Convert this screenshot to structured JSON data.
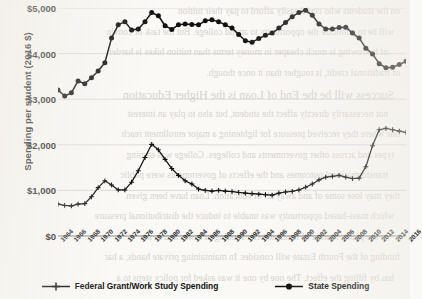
{
  "page": {
    "background_color": "#faf9f6",
    "ink_color": "#111111",
    "bleed_through_lines": [
      "on the students who could easily afford to pay their tuition",
      "will be to publicize the opportunity to attend college. But the task of convin",
      "of borrowing is much cheaper in money terms than tuition hikes is harder",
      "of traditional credit, is tougher than it once though.",
      "Success will be the End of Loan is the Higher Education",
      "not necessarily directly affect the student, but also to play an interest",
      "one where they received pressure for lightening a major enrollment reach",
      "types and across other governments and colleges. College was earning",
      "transformational outcomes and the effects of governments were public",
      "they may lose some of and away all of education. Loan have been given",
      "which mass-based opportunity was unable to induce the distributional pressure",
      "in the public market of hands to offer funding of lower and in the",
      "funding of the Fourth Estate will consider. In maintaining private hands, a har",
      "has by filling the effect. The one by one it was asked for policy steps to a"
    ]
  },
  "chart_data": {
    "type": "line",
    "title": "",
    "xlabel": "",
    "ylabel": "Spending per student (2016 $)",
    "ylim": [
      0,
      5000
    ],
    "yticks": [
      0,
      1000,
      2000,
      3000,
      4000,
      5000
    ],
    "ytick_labels": [
      "$0",
      "$1,000",
      "$2,000",
      "$3,000",
      "$4,000",
      "$5,000"
    ],
    "xlim": [
      1964,
      2016
    ],
    "xtick_labels": [
      "1964",
      "1966",
      "1968",
      "1970",
      "1972",
      "1974",
      "1976",
      "1978",
      "1980",
      "1982",
      "1984",
      "1986",
      "1988",
      "1990",
      "1992",
      "1994",
      "1996",
      "1998",
      "2000",
      "2002",
      "2004",
      "2006",
      "2008",
      "2010",
      "2012",
      "2014",
      "2016"
    ],
    "grid": true,
    "legend_position": "bottom",
    "x": [
      1964,
      1965,
      1966,
      1967,
      1968,
      1969,
      1970,
      1971,
      1972,
      1973,
      1974,
      1975,
      1976,
      1977,
      1978,
      1979,
      1980,
      1981,
      1982,
      1983,
      1984,
      1985,
      1986,
      1987,
      1988,
      1989,
      1990,
      1991,
      1992,
      1993,
      1994,
      1995,
      1996,
      1997,
      1998,
      1999,
      2000,
      2001,
      2002,
      2003,
      2004,
      2005,
      2006,
      2007,
      2008,
      2009,
      2010,
      2011,
      2012,
      2013,
      2014,
      2015,
      2016
    ],
    "series": [
      {
        "name": "Federal Grant/Work Study Spending",
        "marker": "plus",
        "color": "#111111",
        "values": [
          700,
          670,
          660,
          700,
          710,
          860,
          1060,
          1210,
          1120,
          1010,
          1010,
          1180,
          1430,
          1720,
          2010,
          1890,
          1680,
          1480,
          1330,
          1210,
          1140,
          1030,
          1000,
          985,
          1000,
          985,
          975,
          955,
          940,
          930,
          920,
          905,
          895,
          940,
          965,
          980,
          1010,
          1070,
          1140,
          1230,
          1290,
          1310,
          1330,
          1290,
          1260,
          1270,
          1520,
          1980,
          2330,
          2360,
          2330,
          2300,
          2270
        ]
      },
      {
        "name": "State Spending",
        "marker": "circle",
        "color": "#111111",
        "values": [
          3200,
          3070,
          3140,
          3400,
          3340,
          3470,
          3620,
          3800,
          4340,
          4630,
          4700,
          4520,
          4540,
          4700,
          4900,
          4830,
          4610,
          4530,
          4630,
          4650,
          4640,
          4630,
          4720,
          4740,
          4700,
          4630,
          4560,
          4420,
          4280,
          4250,
          4330,
          4400,
          4450,
          4560,
          4680,
          4810,
          4900,
          4950,
          4840,
          4650,
          4540,
          4540,
          4570,
          4580,
          4450,
          4340,
          4120,
          3990,
          3780,
          3690,
          3700,
          3760,
          3830
        ]
      }
    ]
  }
}
